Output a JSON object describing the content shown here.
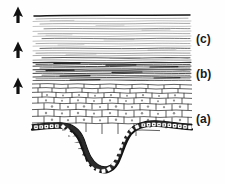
{
  "figure": {
    "type": "histology-line-drawing",
    "background_color": "#fefefe",
    "ink_color": "#1a1a1a",
    "drawing_bounds": {
      "left": 32,
      "top": 14,
      "right": 192,
      "bottom": 172
    }
  },
  "labels": [
    {
      "id": "c",
      "text": "(c)",
      "x": 196,
      "y": 33,
      "layer_name": "stratum-corneum",
      "description": "uppermost layer of long flat wavy horizontal keratin lines"
    },
    {
      "id": "b",
      "text": "(b)",
      "x": 196,
      "y": 68,
      "layer_name": "transitional-granular-layer",
      "description": "dense dark compressed horizontal lines"
    },
    {
      "id": "a",
      "text": "(a)",
      "x": 196,
      "y": 113,
      "layer_name": "basal-cell-layer",
      "description": "dark row of small rectangular basal cells along the wavy base with a deep U-shaped invagination"
    }
  ],
  "arrows": [
    {
      "id": "arrow-1",
      "x": 18,
      "tip_y": 7,
      "tail_y": 23,
      "direction": "up",
      "color": "#111111"
    },
    {
      "id": "arrow-2",
      "x": 18,
      "tip_y": 42,
      "tail_y": 58,
      "direction": "up",
      "color": "#111111"
    },
    {
      "id": "arrow-3",
      "x": 18,
      "tip_y": 78,
      "tail_y": 94,
      "direction": "up",
      "color": "#111111"
    }
  ],
  "layers": [
    {
      "id": "layer-c",
      "name": "stratum-corneum",
      "top": 14,
      "bottom": 62,
      "pattern": "long-wavy-horizontal-lines",
      "density": "sparse"
    },
    {
      "id": "layer-b",
      "name": "transition-zone",
      "top": 62,
      "bottom": 82,
      "pattern": "dense-dark-horizontal-lines",
      "density": "dense"
    },
    {
      "id": "layer-a",
      "name": "stratum-spinosum-basale",
      "top": 82,
      "bottom": 172,
      "pattern": "polygonal-cells-with-basal-row",
      "density": "cellular"
    }
  ]
}
